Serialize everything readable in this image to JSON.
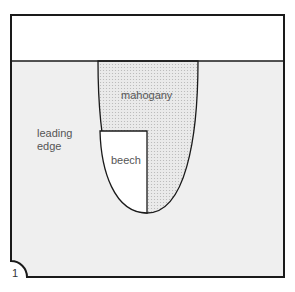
{
  "diagram": {
    "labels": {
      "mahogany": "mahogany",
      "leading_edge_line1": "leading",
      "leading_edge_line2": "edge",
      "beech": "beech",
      "figure_number": "1"
    },
    "colors": {
      "outline": "#1a1a1a",
      "panel_fill": "#efefef",
      "mahogany_fill": "#e2e2e2",
      "beech_fill": "#ffffff",
      "top_band_fill": "#ffffff"
    }
  }
}
